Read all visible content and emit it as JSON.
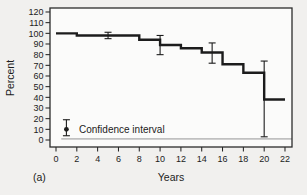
{
  "figure": {
    "panel_label": "(a)"
  },
  "chart_data": {
    "type": "line",
    "subtype": "kaplan-meier-step",
    "xlabel": "Years",
    "ylabel": "Percent",
    "xlim": [
      0,
      22
    ],
    "ylim": [
      0,
      120
    ],
    "xticks": [
      0,
      2,
      4,
      6,
      8,
      10,
      12,
      14,
      16,
      18,
      20,
      22
    ],
    "yticks": [
      0,
      10,
      20,
      30,
      40,
      50,
      60,
      70,
      80,
      90,
      100,
      110,
      120
    ],
    "grid": false,
    "legend_position": "bottom-left-inside",
    "series": [
      {
        "name": "survival-percent",
        "step_points": [
          [
            0,
            100
          ],
          [
            2,
            98
          ],
          [
            8,
            94
          ],
          [
            10,
            89
          ],
          [
            12,
            86
          ],
          [
            14,
            82
          ],
          [
            16,
            71
          ],
          [
            18,
            63
          ],
          [
            20,
            38
          ]
        ],
        "x_end": 22
      }
    ],
    "error_bars": [
      {
        "x": 5,
        "y": 98,
        "lo": 95,
        "hi": 101
      },
      {
        "x": 10,
        "y": 89,
        "lo": 80,
        "hi": 98
      },
      {
        "x": 15,
        "y": 82,
        "lo": 72,
        "hi": 91
      },
      {
        "x": 20,
        "y": 38,
        "lo": 3,
        "hi": 74
      }
    ],
    "baseline_value": 1,
    "legend": {
      "label": "Confidence interval",
      "symbol": {
        "x": 1,
        "dot": 10,
        "lo": 4,
        "hi": 19
      }
    },
    "colors": {
      "ink": "#1c1c1c",
      "frame": "#2b2b2b",
      "baseline": "#8a8a8a",
      "plot_bg": "#fbfbfa",
      "page_bg": "#f1f0ee"
    }
  }
}
